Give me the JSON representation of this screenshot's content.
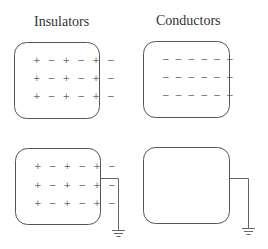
{
  "titles": {
    "insulators": "Insulators",
    "conductors": "Conductors"
  },
  "panels": [
    {
      "id": "insulator-isolated",
      "material": "insulator",
      "grounded": false,
      "rows": [
        "+ − + − + −",
        "+ − + − + −",
        "+ − + − + −"
      ]
    },
    {
      "id": "conductor-isolated",
      "material": "conductor",
      "grounded": false,
      "rows": [
        "− − − − − −",
        "− − − − − −",
        "− − − − − −"
      ]
    },
    {
      "id": "insulator-grounded",
      "material": "insulator",
      "grounded": true,
      "rows": [
        "+ − + − + −",
        "+ − + − + −",
        "+ − + − + −"
      ]
    },
    {
      "id": "conductor-grounded",
      "material": "conductor",
      "grounded": true,
      "rows": []
    }
  ],
  "colors": {
    "stroke": "#555555",
    "charge": "#666666",
    "text": "#333333"
  }
}
